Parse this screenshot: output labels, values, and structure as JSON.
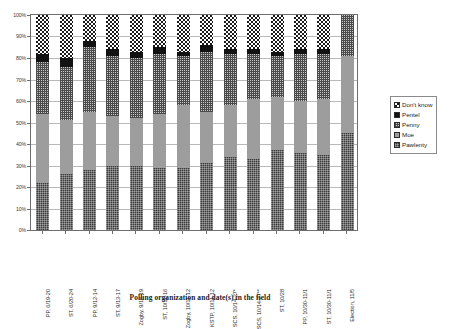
{
  "chart_data": {
    "type": "bar",
    "subtype": "stacked-bar-100-percent",
    "title": "",
    "xlabel": "Polling organization and date(s) in the field",
    "ylabel": "",
    "ylim": [
      0,
      100
    ],
    "ytick_labels": [
      "0%",
      "10%",
      "20%",
      "30%",
      "40%",
      "50%",
      "60%",
      "70%",
      "80%",
      "90%",
      "100%"
    ],
    "ytick_values": [
      0,
      10,
      20,
      30,
      40,
      50,
      60,
      70,
      80,
      90,
      100
    ],
    "grid": true,
    "grid_axis": "y",
    "legend_position": "right",
    "legend_order_top_to_bottom": [
      "Don't know",
      "Pentel",
      "Penny",
      "Moe",
      "Pawlenty"
    ],
    "categories": [
      "PP, 6/19-20",
      "ST, 6/20-24",
      "PP, 9/12-14",
      "ST, 9/13-17",
      "Zogby, 9/18-19",
      "ST, 10/11-16",
      "Zogby, 10/11-12",
      "KSTP, 10/11-12",
      "SCS, 10/14-27*",
      "SCS, 10/14-27**",
      "ST, 10/28",
      "PP, 10/30-11/1",
      "ST, 10/30-11/1",
      "Election, 11/5"
    ],
    "series": [
      {
        "name": "Pawlenty",
        "pattern": "dark-dither",
        "color": "#3a3a3a",
        "values": [
          22,
          26,
          28,
          30,
          30,
          29,
          29,
          31,
          34,
          33,
          37,
          36,
          35,
          45
        ]
      },
      {
        "name": "Moe",
        "pattern": "solid-gray",
        "color": "#9d9d9d",
        "values": [
          32,
          25,
          27,
          23,
          22,
          25,
          29,
          24,
          24,
          28,
          25,
          24,
          26,
          36
        ]
      },
      {
        "name": "Penny",
        "pattern": "crosshatch",
        "color": "#c9c9c9",
        "values": [
          24,
          25,
          30,
          28,
          28,
          28,
          23,
          28,
          24,
          21,
          19,
          22,
          21,
          19
        ]
      },
      {
        "name": "Pentel",
        "pattern": "solid-black",
        "color": "#121212",
        "values": [
          4,
          4,
          3,
          3,
          3,
          3,
          2,
          3,
          2,
          2,
          2,
          2,
          2,
          0
        ]
      },
      {
        "name": "Don't know",
        "pattern": "checkerboard",
        "color": "#ffffff",
        "values": [
          18,
          20,
          12,
          16,
          17,
          15,
          17,
          14,
          16,
          16,
          17,
          16,
          16,
          0
        ]
      }
    ]
  },
  "legend": {
    "items": [
      {
        "label": "Don't know"
      },
      {
        "label": "Pentel"
      },
      {
        "label": "Penny"
      },
      {
        "label": "Moe"
      },
      {
        "label": "Pawlenty"
      }
    ]
  }
}
